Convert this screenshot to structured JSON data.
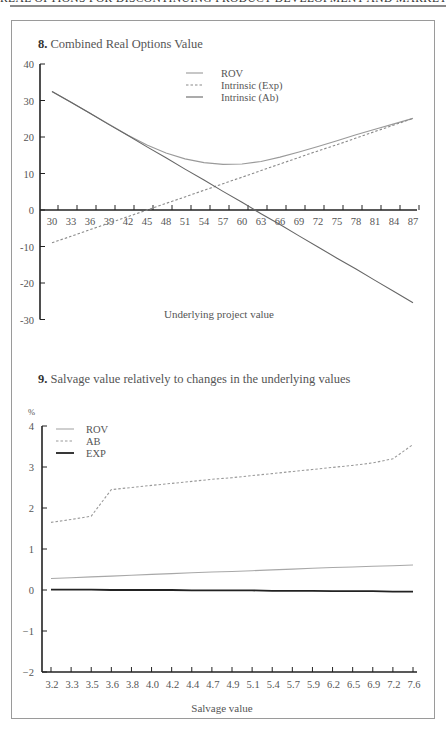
{
  "page": {
    "running_head": "REAL OPTIONS FOR DISCONTINUING PRODUCT DEVELOPMENT AND MARKET EXPANSION"
  },
  "figure8": {
    "number": "8.",
    "title": "Combined Real Options Value"
  },
  "figure9": {
    "number": "9.",
    "title": "Salvage value relatively to changes in the underlying values",
    "unit_label": "%"
  },
  "chart_data": [
    {
      "type": "line",
      "title": "Combined Real Options Value",
      "xlabel": "Underlying project value",
      "ylabel": "",
      "x_ticks": [
        30,
        33,
        36,
        39,
        42,
        45,
        48,
        51,
        54,
        57,
        60,
        63,
        66,
        69,
        72,
        75,
        78,
        81,
        84,
        87
      ],
      "y_ticks": [
        40,
        30,
        20,
        10,
        0,
        -10,
        -20,
        -30
      ],
      "ylim": [
        -30,
        40
      ],
      "xlim": [
        30,
        87
      ],
      "legend_position": "upper-center",
      "grid": false,
      "x": [
        30,
        33,
        36,
        39,
        42,
        45,
        48,
        51,
        54,
        57,
        60,
        63,
        66,
        69,
        72,
        75,
        78,
        81,
        84,
        87
      ],
      "series": [
        {
          "name": "ROV",
          "style": "solid",
          "color": "#9a9a9a",
          "values": [
            32.5,
            29.5,
            26.5,
            23.5,
            20.5,
            17.8,
            15.6,
            14.0,
            13.0,
            12.5,
            12.6,
            13.3,
            14.5,
            15.9,
            17.4,
            19.0,
            20.6,
            22.1,
            23.6,
            25.1
          ]
        },
        {
          "name": "Intrinsic (Exp)",
          "style": "dashed",
          "color": "#8a8a8a",
          "values": [
            -9.0,
            -7.2,
            -5.4,
            -3.6,
            -1.8,
            0.0,
            1.8,
            3.6,
            5.4,
            7.2,
            9.0,
            10.8,
            12.6,
            14.4,
            16.2,
            17.9,
            19.7,
            21.5,
            23.3,
            25.1
          ]
        },
        {
          "name": "Intrinsic (Ab)",
          "style": "solid",
          "color": "#666666",
          "values": [
            32.5,
            29.5,
            26.5,
            23.4,
            20.4,
            17.3,
            14.3,
            11.2,
            8.2,
            5.1,
            2.1,
            -1.0,
            -4.0,
            -7.1,
            -10.1,
            -13.2,
            -16.2,
            -19.3,
            -22.3,
            -25.4
          ]
        }
      ]
    },
    {
      "type": "line",
      "title": "Salvage value relatively to changes in the underlying values",
      "xlabel": "Salvage value",
      "ylabel": "%",
      "x_ticks": [
        "3.2",
        "3.3",
        "3.5",
        "3.6",
        "3.8",
        "4.0",
        "4.2",
        "4.4",
        "4.7",
        "4.9",
        "5.1",
        "5.4",
        "5.7",
        "5.9",
        "6.2",
        "6.5",
        "6.9",
        "7.2",
        "7.6"
      ],
      "y_ticks": [
        4,
        3,
        2,
        1,
        0,
        -1,
        -2
      ],
      "ylim": [
        -2,
        4
      ],
      "legend_position": "upper-left",
      "grid": false,
      "x": [
        3.2,
        3.3,
        3.5,
        3.6,
        3.8,
        4.0,
        4.2,
        4.4,
        4.7,
        4.9,
        5.1,
        5.4,
        5.7,
        5.9,
        6.2,
        6.5,
        6.9,
        7.2,
        7.6
      ],
      "series": [
        {
          "name": "ROV",
          "style": "solid",
          "color": "#a8a8a8",
          "values": [
            0.28,
            0.3,
            0.32,
            0.34,
            0.36,
            0.38,
            0.4,
            0.42,
            0.44,
            0.45,
            0.47,
            0.49,
            0.51,
            0.53,
            0.55,
            0.56,
            0.58,
            0.59,
            0.61
          ]
        },
        {
          "name": "AB",
          "style": "dashed",
          "color": "#9a9a9a",
          "values": [
            1.65,
            1.72,
            1.8,
            2.45,
            2.5,
            2.55,
            2.6,
            2.65,
            2.7,
            2.74,
            2.79,
            2.84,
            2.89,
            2.94,
            2.99,
            3.04,
            3.1,
            3.2,
            3.55
          ]
        },
        {
          "name": "EXP",
          "style": "solid",
          "color": "#222222",
          "values": [
            0.01,
            0.01,
            0.01,
            0.0,
            0.0,
            0.0,
            0.0,
            -0.01,
            -0.01,
            -0.01,
            -0.01,
            -0.02,
            -0.02,
            -0.02,
            -0.03,
            -0.03,
            -0.03,
            -0.04,
            -0.04
          ]
        }
      ]
    }
  ]
}
